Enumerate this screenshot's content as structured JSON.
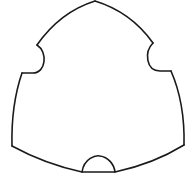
{
  "diagram": {
    "title": "",
    "shape": "reuleaux-triangle",
    "notch_count": 3,
    "notch_shape": "semicircle",
    "line_color": "#1a1a1a",
    "background": "#ffffff",
    "notches": [
      {
        "name": "left-notch",
        "side": "left"
      },
      {
        "name": "right-notch",
        "side": "right"
      },
      {
        "name": "bottom-notch",
        "side": "bottom"
      }
    ]
  }
}
